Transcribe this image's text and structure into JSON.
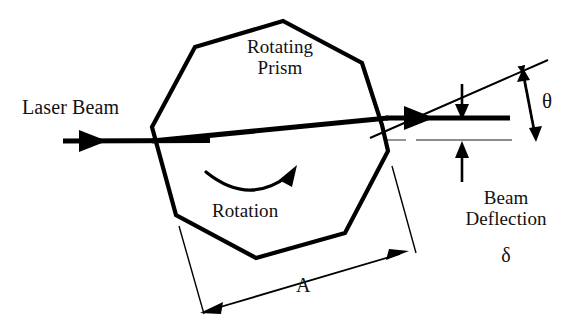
{
  "figure": {
    "type": "technical-diagram",
    "background_color": "#ffffff",
    "line_color": "#000000",
    "thin_line_color": "#555555"
  },
  "labels": {
    "laser_beam": "Laser Beam",
    "rotating_prism_line1": "Rotating",
    "rotating_prism_line2": "Prism",
    "rotation": "Rotation",
    "dimension_a": "A",
    "theta": "θ",
    "beam_deflection_line1": "Beam",
    "beam_deflection_line2": "Deflection",
    "delta": "δ"
  },
  "geometry": {
    "prism": {
      "shape": "octagon",
      "vertices": "152,127 195,47 283,21 362,63 382,125 388,151 345,233 256,258 176,215"
    },
    "incoming_beam": {
      "x1": 63,
      "y1": 141,
      "x2": 205,
      "y2": 140
    },
    "internal_beam": {
      "x1": 152,
      "y1": 141,
      "x2": 388,
      "y2": 118
    },
    "exit_beam": {
      "x1": 388,
      "y1": 118,
      "x2": 510,
      "y2": 118
    },
    "upper_slant_line": {
      "x1": 370,
      "y1": 138,
      "x2": 545,
      "y2": 62
    },
    "reference_line_y": 140,
    "theta_arrow": {
      "x1": 522,
      "y1": 70,
      "x2": 535,
      "y2": 140
    },
    "delta_arrow_top": {
      "x": 462,
      "y1": 88,
      "y2": 118
    },
    "delta_arrow_bottom": {
      "x": 462,
      "y1": 180,
      "y2": 142
    },
    "dimension_a_line": {
      "x1": 205,
      "y1": 312,
      "x2": 407,
      "y2": 252
    }
  }
}
